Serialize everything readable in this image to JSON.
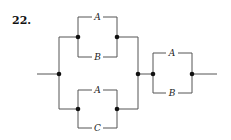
{
  "problem": {
    "number": "22."
  },
  "diagram": {
    "type": "series-parallel switching circuit",
    "left_block": {
      "upper_parallel": {
        "top": "A",
        "bottom": "B"
      },
      "lower_parallel": {
        "top": "A",
        "bottom": "C"
      }
    },
    "right_block": {
      "top": "A",
      "bottom": "B"
    }
  },
  "colors": {
    "wire": "#555555",
    "node": "#111111",
    "background": "#ffffff"
  }
}
